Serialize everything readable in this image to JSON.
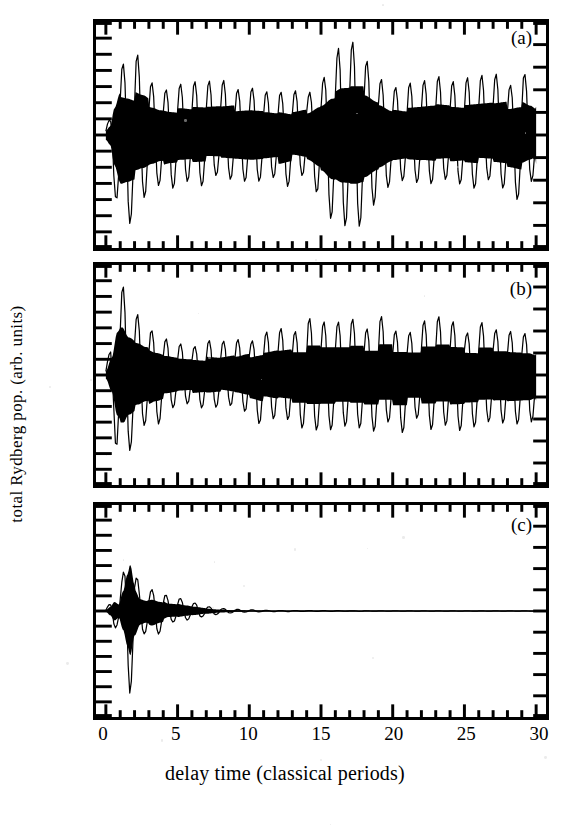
{
  "figure": {
    "x_axis_title": "delay time (classical periods)",
    "y_axis_title": "total Rydberg pop. (arb. units)",
    "x_tick_labels": [
      "0",
      "5",
      "10",
      "15",
      "20",
      "25",
      "30"
    ],
    "panel_labels": [
      "(a)",
      "(b)",
      "(c)"
    ],
    "ink_color": "#000000",
    "background_color": "#ffffff"
  },
  "chart_data": [
    {
      "type": "line",
      "panel": "(a)",
      "title": "",
      "xlabel": "delay time (classical periods)",
      "ylabel": "total Rydberg pop. (arb. units)",
      "xlim": [
        0,
        30
      ],
      "ylim": [
        -1,
        1
      ],
      "xticks": [
        0,
        5,
        10,
        15,
        20,
        25,
        30
      ],
      "xminor_per_major": 5,
      "yticks_labeled": false,
      "grid": false,
      "legend": "none",
      "carrier_periods_per_unit": 1.0,
      "description": "Dense carrier oscillation at one cycle per classical period with a strongly modulated revival envelope; signal persists across the full 30-period window.",
      "envelope_x": [
        0.0,
        0.3,
        0.6,
        1.0,
        1.5,
        2.0,
        2.6,
        3.2,
        3.8,
        4.5,
        5.2,
        6.0,
        7.0,
        8.0,
        9.0,
        10.0,
        11.0,
        12.0,
        13.0,
        14.0,
        15.0,
        15.8,
        16.5,
        17.2,
        18.0,
        19.0,
        20.0,
        21.0,
        22.0,
        23.0,
        24.0,
        25.0,
        26.0,
        27.0,
        28.0,
        29.0,
        29.6,
        30.0
      ],
      "envelope_y": [
        0.1,
        0.2,
        0.62,
        0.97,
        0.93,
        0.88,
        0.82,
        0.72,
        0.65,
        0.6,
        0.58,
        0.56,
        0.55,
        0.56,
        0.58,
        0.6,
        0.58,
        0.55,
        0.5,
        0.55,
        0.72,
        0.9,
        0.99,
        1.0,
        0.95,
        0.78,
        0.62,
        0.58,
        0.6,
        0.62,
        0.6,
        0.58,
        0.6,
        0.62,
        0.65,
        0.7,
        0.62,
        0.55
      ]
    },
    {
      "type": "line",
      "panel": "(b)",
      "title": "",
      "xlabel": "delay time (classical periods)",
      "ylabel": "total Rydberg pop. (arb. units)",
      "xlim": [
        0,
        30
      ],
      "ylim": [
        -1,
        1
      ],
      "xticks": [
        0,
        5,
        10,
        15,
        20,
        25,
        30
      ],
      "xminor_per_major": 5,
      "yticks_labeled": false,
      "grid": false,
      "legend": "none",
      "carrier_periods_per_unit": 1.0,
      "description": "Large initial transient near t=1 that collapses by t=8, then a steady partial revival of nearly constant amplitude out to t=30.",
      "envelope_x": [
        0.0,
        0.4,
        0.8,
        1.1,
        1.6,
        2.2,
        2.8,
        3.5,
        4.2,
        5.0,
        6.0,
        7.0,
        8.0,
        9.0,
        10.0,
        11.0,
        12.0,
        13.0,
        14.0,
        15.0,
        16.0,
        17.0,
        18.0,
        20.0,
        22.0,
        24.0,
        26.0,
        28.0,
        29.5,
        30.0
      ],
      "envelope_y": [
        0.08,
        0.35,
        0.88,
        1.0,
        0.78,
        0.68,
        0.6,
        0.52,
        0.46,
        0.42,
        0.4,
        0.38,
        0.36,
        0.4,
        0.46,
        0.52,
        0.57,
        0.6,
        0.6,
        0.6,
        0.6,
        0.6,
        0.6,
        0.6,
        0.6,
        0.6,
        0.58,
        0.57,
        0.55,
        0.5
      ]
    },
    {
      "type": "line",
      "panel": "(c)",
      "title": "",
      "xlabel": "delay time (classical periods)",
      "ylabel": "total Rydberg pop. (arb. units)",
      "xlim": [
        0,
        30
      ],
      "ylim": [
        -1,
        1
      ],
      "xticks": [
        0,
        5,
        10,
        15,
        20,
        25,
        30
      ],
      "xminor_per_major": 5,
      "yticks_labeled": false,
      "grid": false,
      "legend": "none",
      "carrier_periods_per_unit": 1.0,
      "description": "Short burst peaking near t=1.7 that damps rapidly; essentially a flat baseline beyond t=9 with no revival.",
      "envelope_x": [
        0.0,
        0.3,
        0.6,
        0.9,
        1.2,
        1.5,
        1.7,
        2.0,
        2.4,
        2.8,
        3.2,
        3.8,
        4.4,
        5.0,
        5.6,
        6.2,
        7.0,
        8.0,
        9.0,
        10.0,
        12.0,
        15.0,
        20.0,
        25.0,
        30.0
      ],
      "envelope_y": [
        0.02,
        0.1,
        0.22,
        0.16,
        0.42,
        0.78,
        1.0,
        0.55,
        0.3,
        0.26,
        0.3,
        0.24,
        0.16,
        0.15,
        0.12,
        0.09,
        0.06,
        0.035,
        0.02,
        0.013,
        0.007,
        0.004,
        0.002,
        0.001,
        0.001
      ]
    }
  ]
}
